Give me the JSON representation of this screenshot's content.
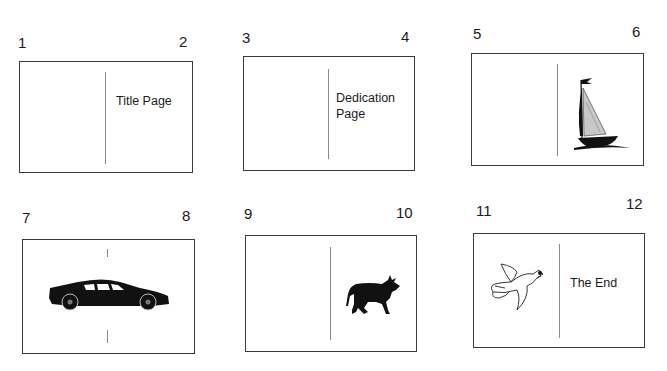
{
  "spreads": [
    {
      "left_page": "1",
      "right_page": "2",
      "right_text": "Title Page",
      "right_image": null,
      "left_image": null
    },
    {
      "left_page": "3",
      "right_page": "4",
      "right_text": "Dedication Page",
      "right_text_lines": [
        "Dedication",
        "Page"
      ],
      "right_image": null,
      "left_image": null
    },
    {
      "left_page": "5",
      "right_page": "6",
      "right_text": null,
      "right_image": "sailboat-illustration",
      "left_image": null
    },
    {
      "left_page": "7",
      "right_page": "8",
      "right_text": null,
      "image_across_spread": "sports-car-silhouette"
    },
    {
      "left_page": "9",
      "right_page": "10",
      "right_text": null,
      "right_image": "bull-silhouette",
      "left_image": null
    },
    {
      "left_page": "11",
      "right_page": "12",
      "left_image": "seagull-line-drawing",
      "right_text": "The End"
    }
  ],
  "colors": {
    "border": "#3a3a3a",
    "divider": "#8a8a8a",
    "ink": "#111111"
  }
}
